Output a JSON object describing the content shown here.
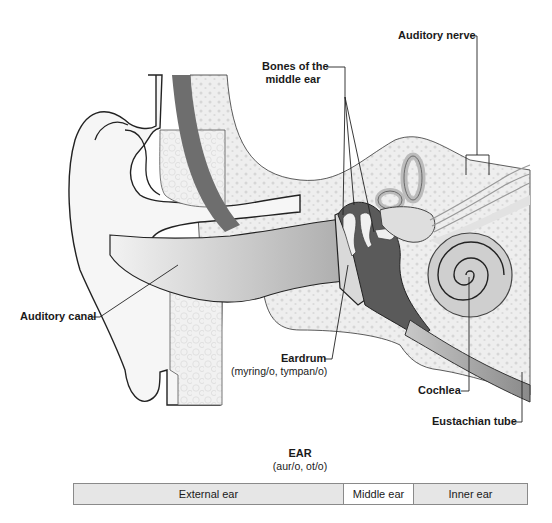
{
  "diagram": {
    "title": "EAR",
    "subtitle": "(aur/o, ot/o)",
    "labels": {
      "auditory_nerve": "Auditory nerve",
      "bones_line1": "Bones of the",
      "bones_line2": "middle ear",
      "auditory_canal": "Auditory canal",
      "eardrum": "Eardrum",
      "eardrum_sub": "(myring/o, tympan/o)",
      "cochlea": "Cochlea",
      "eustachian_tube": "Eustachian tube"
    },
    "regions": [
      {
        "label": "External ear",
        "shade": "grey"
      },
      {
        "label": "Middle ear",
        "shade": "white"
      },
      {
        "label": "Inner ear",
        "shade": "grey"
      }
    ],
    "colors": {
      "bone": "#eeeeee",
      "skin": "#f7f7f7",
      "dark_band": "#6e6e6e",
      "middle_ear_cavity": "#5a5a5a",
      "canal": "#c9c9c9",
      "outline": "#222222",
      "segment_grey": "#e6e6e6"
    }
  }
}
